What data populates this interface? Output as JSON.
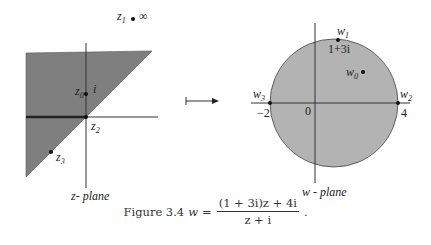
{
  "figure": {
    "number_label": "Figure 3.4",
    "formula": {
      "lhs": "w",
      "equals": "=",
      "numerator": "(1 + 3i)z + 4i",
      "denominator": "z + i",
      "trailing": "."
    }
  },
  "z_plane": {
    "title": "z- plane",
    "region_fill": "#7f7f7f",
    "points": {
      "z0": {
        "label": "z",
        "sub": "0",
        "value_label": "i"
      },
      "z1": {
        "label": "z",
        "sub": "1",
        "value_label": "∞"
      },
      "z2": {
        "label": "z",
        "sub": "2"
      },
      "z3": {
        "label": "z",
        "sub": "3"
      }
    }
  },
  "mapping_arrow": {
    "symbol": "↦"
  },
  "w_plane": {
    "title": "w - plane",
    "disk_fill": "#b3b3b3",
    "origin_label": "0",
    "points": {
      "w0": {
        "label": "w",
        "sub": "0"
      },
      "w1": {
        "label": "w",
        "sub": "1",
        "value_label": "1+3i"
      },
      "w2": {
        "label": "w",
        "sub": "2",
        "value_label": "4"
      },
      "w3": {
        "label": "w",
        "sub": "3",
        "value_label": "−2"
      }
    }
  }
}
